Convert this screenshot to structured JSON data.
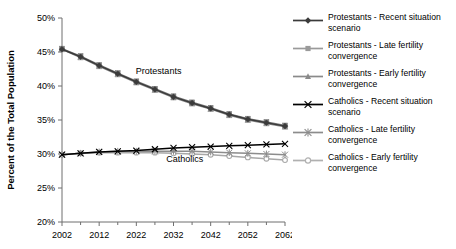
{
  "chart_data": {
    "type": "line",
    "title": "",
    "xlabel": "",
    "ylabel": "Percent of the Total Population",
    "xlim": [
      2002,
      2062
    ],
    "ylim": [
      20,
      50
    ],
    "ytick_labels": [
      "50%",
      "45%",
      "40%",
      "35%",
      "30%",
      "25%",
      "20%"
    ],
    "ytick_values": [
      50,
      45,
      40,
      35,
      30,
      25,
      20
    ],
    "xtick_labels": [
      "2002",
      "2012",
      "2022",
      "2032",
      "2042",
      "2052",
      "2062"
    ],
    "xtick_values": [
      2002,
      2012,
      2022,
      2032,
      2042,
      2052,
      2062
    ],
    "x_minor_ticks": [
      2007,
      2017,
      2027,
      2037,
      2047,
      2057
    ],
    "grid": false,
    "legend_position": "right",
    "x": [
      2002,
      2007,
      2012,
      2017,
      2022,
      2027,
      2032,
      2037,
      2042,
      2047,
      2052,
      2057,
      2062
    ],
    "series": [
      {
        "name": "Protestants - Recent situation scenario",
        "marker": "diamond",
        "color": "#3b3b3b",
        "values": [
          45.4,
          44.3,
          43.0,
          41.8,
          40.6,
          39.5,
          38.4,
          37.5,
          36.7,
          35.8,
          35.1,
          34.6,
          34.1
        ]
      },
      {
        "name": "Protestants - Late fertility convergence",
        "marker": "square",
        "color": "#7a7a7a",
        "values": [
          45.5,
          44.4,
          43.1,
          41.9,
          40.7,
          39.6,
          38.5,
          37.6,
          36.8,
          35.9,
          35.2,
          34.7,
          34.2
        ]
      },
      {
        "name": "Protestants - Early fertility convergence",
        "marker": "triangle",
        "color": "#8a8a8a",
        "values": [
          45.4,
          44.2,
          42.9,
          41.7,
          40.5,
          39.4,
          38.3,
          37.4,
          36.6,
          35.7,
          35.0,
          34.5,
          34.0
        ]
      },
      {
        "name": "Catholics - Recent situation scenario",
        "marker": "cross",
        "color": "#000000",
        "values": [
          29.9,
          30.1,
          30.3,
          30.4,
          30.5,
          30.7,
          30.9,
          31.0,
          31.1,
          31.2,
          31.3,
          31.4,
          31.5
        ]
      },
      {
        "name": "Catholics - Late fertility convergence",
        "marker": "asterisk",
        "color": "#8c8c8c",
        "values": [
          29.9,
          30.1,
          30.3,
          30.4,
          30.4,
          30.4,
          30.4,
          30.4,
          30.3,
          30.2,
          30.1,
          30.0,
          29.9
        ]
      },
      {
        "name": "Catholics - Early fertility convergence",
        "marker": "circle",
        "color": "#a8a8a8",
        "values": [
          29.9,
          30.1,
          30.2,
          30.2,
          30.2,
          30.2,
          30.1,
          30.0,
          29.9,
          29.7,
          29.5,
          29.3,
          29.1
        ]
      }
    ],
    "annotations": [
      {
        "text": "Protestants",
        "x": 2028,
        "y": 41.7
      },
      {
        "text": "Catholics",
        "x": 2035,
        "y": 28.8
      }
    ]
  },
  "legend": {
    "items": [
      {
        "label": "Protestants - Recent situation\nscenario",
        "marker": "diamond",
        "color": "#3b3b3b"
      },
      {
        "label": "Protestants - Late fertility\nconvergence",
        "marker": "square",
        "color": "#9a9a9a"
      },
      {
        "label": "Protestants - Early fertility\nconvergence",
        "marker": "triangle",
        "color": "#8a8a8a"
      },
      {
        "label": "Catholics - Recent situation\nscenario",
        "marker": "cross",
        "color": "#000000"
      },
      {
        "label": "Catholics - Late fertility\nconvergence",
        "marker": "asterisk",
        "color": "#8c8c8c"
      },
      {
        "label": "Catholics - Early fertility\nconvergence",
        "marker": "circle",
        "color": "#b0b0b0"
      }
    ]
  }
}
